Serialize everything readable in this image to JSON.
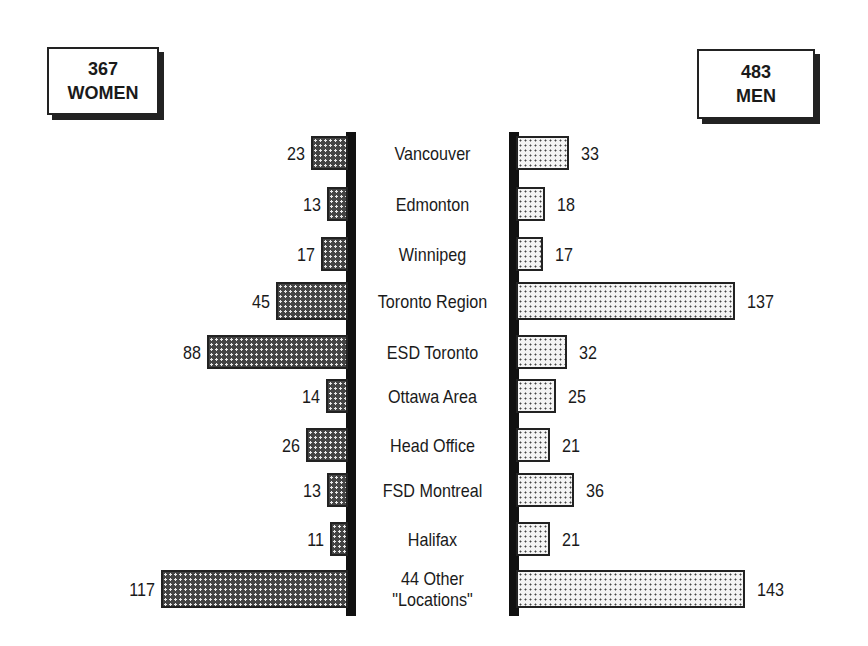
{
  "legend": {
    "women": {
      "count": "367",
      "label": "WOMEN"
    },
    "men": {
      "count": "483",
      "label": "MEN"
    }
  },
  "chart_data": {
    "type": "bar",
    "orientation": "horizontal",
    "layout": "back-to-back (population pyramid style)",
    "title": "",
    "categories": [
      "Vancouver",
      "Edmonton",
      "Winnipeg",
      "Toronto Region",
      "ESD Toronto",
      "Ottawa Area",
      "Head Office",
      "FSD Montreal",
      "Halifax",
      "44 Other \"Locations\""
    ],
    "series": [
      {
        "name": "367 WOMEN",
        "side": "left",
        "fill": "dark cross-hatch",
        "values": [
          23,
          13,
          17,
          45,
          88,
          14,
          26,
          13,
          11,
          117
        ]
      },
      {
        "name": "483 MEN",
        "side": "right",
        "fill": "light dot stipple",
        "values": [
          33,
          18,
          17,
          137,
          32,
          25,
          21,
          36,
          21,
          143
        ]
      }
    ],
    "totals": {
      "women": 367,
      "men": 483
    },
    "xlabel": "",
    "ylabel": "",
    "grid": false,
    "legend_position": "top corners (boxed)"
  },
  "rows": [
    {
      "label": "Vancouver",
      "women": "23",
      "men": "33"
    },
    {
      "label": "Edmonton",
      "women": "13",
      "men": "18"
    },
    {
      "label": "Winnipeg",
      "women": "17",
      "men": "17"
    },
    {
      "label": "Toronto Region",
      "women": "45",
      "men": "137"
    },
    {
      "label": "ESD Toronto",
      "women": "88",
      "men": "32"
    },
    {
      "label": "Ottawa Area",
      "women": "14",
      "men": "25"
    },
    {
      "label": "Head Office",
      "women": "26",
      "men": "21"
    },
    {
      "label": "FSD Montreal",
      "women": "13",
      "men": "36"
    },
    {
      "label": "Halifax",
      "women": "11",
      "men": "21"
    },
    {
      "label": "44 Other\n\"Locations\"",
      "women": "117",
      "men": "143"
    }
  ]
}
